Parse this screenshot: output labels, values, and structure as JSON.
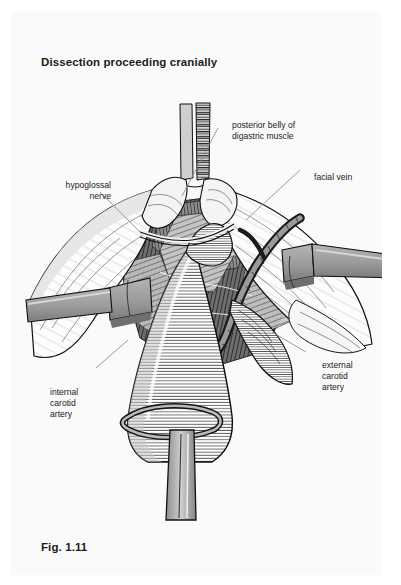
{
  "page": {
    "title": "Dissection proceeding cranially",
    "figure_caption": "Fig. 1.11",
    "background_color": "#fafafa",
    "ink_color": "#1a1a1a"
  },
  "illustration": {
    "name": "surgical-dissection-neck-carotid",
    "description": "Line-drawing of a cranially proceeding neck dissection showing the carotid bifurcation with retractors, clamped digastric muscle and mobilized facial vein",
    "palette": {
      "outline": "#101010",
      "retractor_fill": "#9c9c9c",
      "retractor_shadow": "#7a7a7a",
      "vessel_fill": "#8f8f8f",
      "deep_tissue": "#4a4a4a",
      "mid_tissue": "#bdbdbd",
      "light_tissue": "#f2f2f2",
      "leader_line": "#8a8a8a"
    }
  },
  "callouts": [
    {
      "id": "posterior-belly-digastric",
      "label": "posterior belly of\ndigastric muscle",
      "align": "left",
      "x": 221,
      "y": 108
    },
    {
      "id": "facial-vein",
      "label": "facial vein",
      "align": "left",
      "x": 303,
      "y": 160
    },
    {
      "id": "hypoglossal-nerve",
      "label": "hypoglossal\nnerve",
      "align": "right",
      "x": 41,
      "y": 168
    },
    {
      "id": "external-carotid-artery",
      "label": "external\ncarotid\nartery",
      "align": "left",
      "x": 311,
      "y": 348
    },
    {
      "id": "internal-carotid-artery",
      "label": "internal\ncarotid\nartery",
      "align": "left",
      "x": 39,
      "y": 375
    }
  ],
  "leader_lines": [
    {
      "id": "leader-posterior-belly-digastric",
      "from": [
        218,
        128
      ],
      "to": [
        182,
        196
      ]
    },
    {
      "id": "leader-facial-vein",
      "from": [
        300,
        170
      ],
      "to": [
        246,
        220
      ]
    },
    {
      "id": "leader-hypoglossal-nerve",
      "from": [
        100,
        192
      ],
      "to": [
        140,
        232
      ]
    },
    {
      "id": "leader-external-carotid-artery",
      "from": [
        306,
        352
      ],
      "to": [
        272,
        332
      ]
    },
    {
      "id": "leader-internal-carotid-artery",
      "from": [
        96,
        368
      ],
      "to": [
        126,
        342
      ]
    }
  ]
}
